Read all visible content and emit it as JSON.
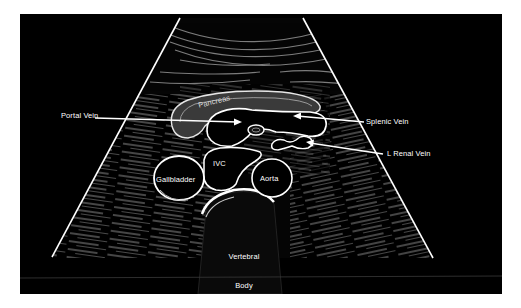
{
  "figure": {
    "colors": {
      "background": "#000000",
      "outline": "#ffffff",
      "tissue": "#6a6a6a",
      "page": "#ffffff"
    }
  },
  "labels": {
    "pancreas": "Pancreas",
    "portal_vein": "Portal Vein",
    "splenic_vein": "Splenic Vein",
    "l_renal_vein": "L Renal Vein",
    "ivc": "IVC",
    "aorta": "Aorta",
    "gallbladder": "Gallbladder",
    "vertebral_line1": "Vertebral",
    "vertebral_line2": "Body",
    "vertebral_line3": "Shadow"
  },
  "structures": [
    {
      "name": "Pancreas",
      "labeled": true
    },
    {
      "name": "Portal Vein",
      "labeled": true,
      "pointer": "arrow-right"
    },
    {
      "name": "Splenic Vein",
      "labeled": true,
      "pointer": "arrow-left"
    },
    {
      "name": "L Renal Vein",
      "labeled": true,
      "pointer": "arrow-left"
    },
    {
      "name": "IVC",
      "labeled": true
    },
    {
      "name": "Aorta",
      "labeled": true
    },
    {
      "name": "Gallbladder",
      "labeled": true
    },
    {
      "name": "Vertebral Body Shadow",
      "labeled": true
    },
    {
      "name": "SMA",
      "labeled": false
    }
  ]
}
